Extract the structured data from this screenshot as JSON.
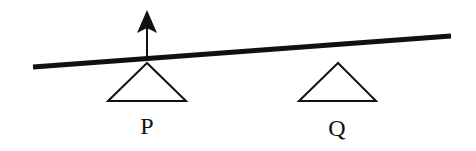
{
  "diagram": {
    "type": "beam-on-supports",
    "colors": {
      "background": "#ffffff",
      "stroke": "#111111"
    },
    "beam": {
      "x1": 33,
      "y1": 67,
      "x2": 451,
      "y2": 36,
      "thickness": 5
    },
    "supports": [
      {
        "id": "P",
        "label": "P",
        "apex": [
          147,
          63
        ],
        "base_left": [
          108,
          101
        ],
        "base_right": [
          186,
          101
        ],
        "label_pos": [
          147,
          134
        ]
      },
      {
        "id": "Q",
        "label": "Q",
        "apex": [
          338,
          63
        ],
        "base_left": [
          299,
          101
        ],
        "base_right": [
          376,
          101
        ],
        "label_pos": [
          337,
          136
        ]
      }
    ],
    "force_arrow": {
      "direction": "up",
      "at_support": "P",
      "x": 147,
      "y_start": 59,
      "y_tip": 10
    }
  }
}
